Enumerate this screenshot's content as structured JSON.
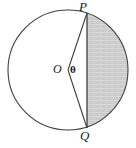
{
  "figure": {
    "type": "geometry-diagram",
    "labels": {
      "point_p": "P",
      "point_q": "Q",
      "center_o": "O",
      "angle_theta": "θ"
    },
    "colors": {
      "stroke": "#3a3a3a",
      "segment_fill": "#cccccc",
      "segment_texture": "#dcdcdc",
      "background": "#ffffff",
      "label": "#1a1a1a"
    },
    "geometry": {
      "circle_center_x": 68,
      "circle_center_y": 70,
      "circle_radius": 60,
      "point_p_x": 87,
      "point_p_y": 13,
      "point_q_x": 87,
      "point_q_y": 128,
      "chord_label": "PQ",
      "radius_labels": [
        "OP",
        "OQ"
      ]
    }
  }
}
